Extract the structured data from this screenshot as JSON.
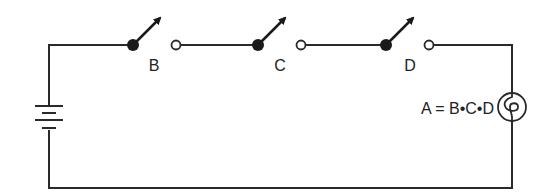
{
  "diagram": {
    "type": "circuit",
    "colors": {
      "wire": "#2a2a2a",
      "background": "#ffffff"
    },
    "switches": [
      {
        "id": "B",
        "label": "B",
        "state": "open"
      },
      {
        "id": "C",
        "label": "C",
        "state": "open"
      },
      {
        "id": "D",
        "label": "D",
        "state": "open"
      }
    ],
    "source": {
      "type": "battery",
      "icon": "battery-icon"
    },
    "load": {
      "type": "lamp",
      "icon": "lamp-icon"
    },
    "equation": "A = B•C•D"
  }
}
